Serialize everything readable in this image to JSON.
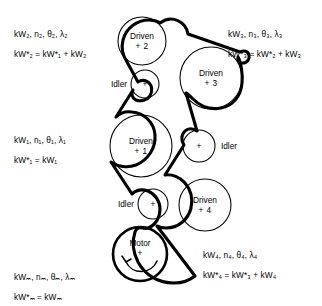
{
  "diagram": {
    "background_color": "#ffffff",
    "line_color": "#000000",
    "pulleys": [
      {
        "id": "driven-2",
        "name": "Driven",
        "number": "+ 2",
        "kind": "driven",
        "cx": 142,
        "cy": 41,
        "r": 24,
        "stroke": 1.0
      },
      {
        "id": "idler-top",
        "name": "Idler",
        "number": "+",
        "kind": "idler",
        "cx": 145,
        "cy": 84,
        "r": 14,
        "stroke": 1.0,
        "label_side": "left"
      },
      {
        "id": "driven-3",
        "name": "Driven",
        "number": "+ 3",
        "kind": "driven",
        "cx": 211,
        "cy": 78,
        "r": 31,
        "stroke": 1.0
      },
      {
        "id": "driven-1",
        "name": "Driven",
        "number": "+ 1",
        "kind": "driven",
        "cx": 141,
        "cy": 146,
        "r": 31,
        "stroke": 1.0
      },
      {
        "id": "idler-right",
        "name": "Idler",
        "number": "+",
        "kind": "idler",
        "cx": 199,
        "cy": 146,
        "r": 16,
        "stroke": 1.0,
        "label_side": "right"
      },
      {
        "id": "idler-bottom",
        "name": "Idler",
        "number": "+",
        "kind": "idler",
        "cx": 153,
        "cy": 204,
        "r": 15,
        "stroke": 1.0,
        "label_side": "left"
      },
      {
        "id": "driven-4",
        "name": "Driven",
        "number": "+ 4",
        "kind": "driven",
        "cx": 205,
        "cy": 205,
        "r": 26,
        "stroke": 1.0
      },
      {
        "id": "motor",
        "name": "Motor",
        "number": "+",
        "kind": "motor",
        "cx": 140,
        "cy": 254,
        "r": 27,
        "stroke": 2.6,
        "rotation": "counterclockwise"
      }
    ],
    "annotations": [
      {
        "id": "annot-2",
        "position": "top-left",
        "x": 14,
        "y": 30,
        "line1_parts": [
          "kW",
          "2",
          ", ",
          "n",
          "2",
          ", θ",
          "2",
          ", λ",
          "2"
        ],
        "line1": "kW₂, n₂, θ₂, λ₂",
        "line2": "kW*₂ = kW*₁ + kW₂"
      },
      {
        "id": "annot-3",
        "position": "top-right",
        "x": 228,
        "y": 30,
        "line1": "kW₃, n₃, θ₃, λ₃",
        "line2": "kW*₃ = kW*₂ + kW₃"
      },
      {
        "id": "annot-1",
        "position": "middle-left",
        "x": 14,
        "y": 136,
        "line1": "kW₁, n₁, θ₁, λ₁",
        "line2": "kW*₁ = kW₁"
      },
      {
        "id": "annot-4",
        "position": "bottom-right",
        "x": 203,
        "y": 251,
        "line1": "kW₄, n₄, θ₄, λ₄",
        "line2": "kW*₄ = kW*₃ + kW₄"
      },
      {
        "id": "annot-m",
        "position": "bottom-left",
        "x": 14,
        "y": 273,
        "line1": "kWₘ, nₘ, θₘ, λₘ",
        "line2": "kW*ₘ = kWₘ"
      }
    ]
  }
}
